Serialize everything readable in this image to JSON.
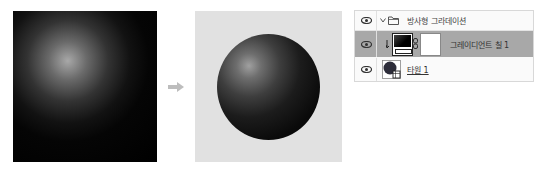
{
  "figure": {
    "before_label": "",
    "after_label": "",
    "arrow_color": "#bdbdbd",
    "left_image": "radial-gradient-fill-only",
    "right_image": "radial-gradient-clipped-to-circle"
  },
  "layers_panel": {
    "group": {
      "name": "방사형 그라데이션",
      "expanded": true,
      "icons": [
        "eye-icon",
        "chevron-down-icon",
        "folder-icon"
      ]
    },
    "layers": [
      {
        "name": "그레이디언트 칠 1",
        "selected": true,
        "clipped": true,
        "icons": [
          "eye-icon",
          "clip-arrow-icon",
          "gradient-fill-thumbnail",
          "link-icon",
          "mask-thumbnail"
        ]
      },
      {
        "name": "타원 1",
        "selected": false,
        "icons": [
          "eye-icon",
          "shape-thumbnail"
        ]
      }
    ],
    "colors": {
      "selected_row": "#a8a8a8",
      "panel_bg": "#fafafa"
    }
  }
}
